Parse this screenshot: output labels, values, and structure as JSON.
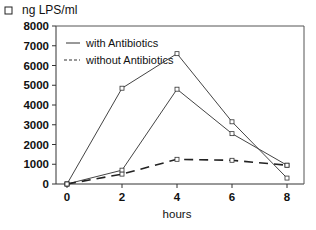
{
  "chart_data": {
    "type": "line",
    "title": "ng LPS/ml",
    "xlabel": "hours",
    "ylabel": "ng LPS/ml",
    "x": [
      0,
      2,
      4,
      6,
      8
    ],
    "xticks": [
      "0",
      "2",
      "4",
      "6",
      "8"
    ],
    "yticks": [
      "0",
      "1000",
      "2000",
      "3000",
      "4000",
      "5000",
      "6000",
      "7000",
      "8000"
    ],
    "ylim": [
      0,
      8000
    ],
    "xlim": [
      0,
      8
    ],
    "grid": false,
    "legend_position": "upper-left inside",
    "legend": [
      {
        "label": "with Antibiotics",
        "style": "solid"
      },
      {
        "label": "without Antibiotics",
        "style": "dashed"
      }
    ],
    "series": [
      {
        "name": "with Antibiotics (1)",
        "style": "solid",
        "values": [
          0,
          4850,
          6600,
          3150,
          300
        ]
      },
      {
        "name": "with Antibiotics (2)",
        "style": "solid",
        "values": [
          0,
          700,
          4800,
          2550,
          950
        ]
      },
      {
        "name": "without Antibiotics",
        "style": "dashed",
        "values": [
          0,
          500,
          1250,
          1200,
          950
        ]
      }
    ]
  },
  "labels": {
    "title_marker": "□",
    "title": "ng LPS/ml",
    "xlabel": "hours",
    "legend_solid": "with Antibiotics",
    "legend_dashed": "without Antibiotics"
  }
}
